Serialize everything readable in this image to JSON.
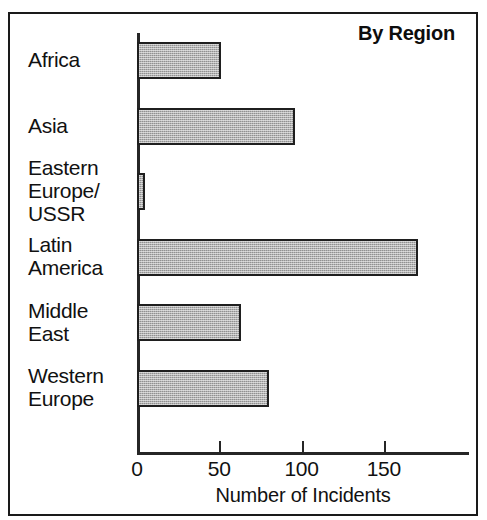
{
  "chart_data": {
    "type": "bar",
    "orientation": "horizontal",
    "title": "By Region",
    "xlabel": "Number of Incidents",
    "ylabel": "",
    "categories": [
      "Africa",
      "Asia",
      "Eastern Europe/ USSR",
      "Latin America",
      "Middle East",
      "Western Europe"
    ],
    "category_lines": [
      [
        "Africa"
      ],
      [
        "Asia"
      ],
      [
        "Eastern",
        "Europe/",
        "USSR"
      ],
      [
        "Latin",
        "America"
      ],
      [
        "Middle",
        "East"
      ],
      [
        "Western",
        "Europe"
      ]
    ],
    "values": [
      51,
      96,
      5,
      171,
      63,
      80
    ],
    "xlim": [
      0,
      200
    ],
    "xticks": [
      0,
      50,
      100,
      150
    ],
    "xtick_labels": [
      "0",
      "50",
      "100",
      "150"
    ],
    "grid": false,
    "legend": false,
    "bar_fill_color": "#919191",
    "bar_edge_color": "#1f1f1f",
    "axis_color": "#262626",
    "text_color": "#111111"
  }
}
